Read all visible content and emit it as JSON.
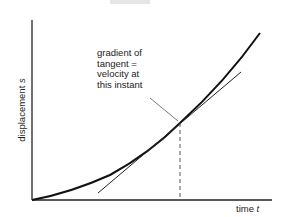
{
  "diagram": {
    "annotation_lines": [
      "gradient of",
      "tangent =",
      "velocity at",
      "this instant"
    ],
    "y_axis": {
      "label": "displacement",
      "symbol": "s"
    },
    "x_axis": {
      "label": "time",
      "symbol": "t"
    },
    "colors": {
      "curve": "#111111",
      "axes": "#222222",
      "tangent": "#222222",
      "dashed": "#555555",
      "pointer": "#555555"
    }
  }
}
